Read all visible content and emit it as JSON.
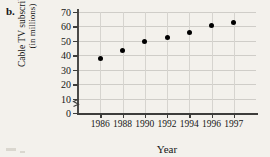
{
  "figure": {
    "problem_label": "b."
  },
  "chart_data": {
    "type": "scatter",
    "title": "",
    "xlabel": "Year",
    "ylabel_line1": "Cable TV subscribers",
    "ylabel_line2": "(in millions)",
    "categories": [
      "1986",
      "1988",
      "1990",
      "1992",
      "1994",
      "1996",
      "1997"
    ],
    "values": [
      37.5,
      43.5,
      49.5,
      52.5,
      56,
      60.5,
      62.5
    ],
    "x": [
      1986,
      1988,
      1990,
      1992,
      1994,
      1996,
      1997
    ],
    "ylim": [
      0,
      70
    ],
    "yticks": [
      0,
      10,
      20,
      30,
      40,
      50,
      60,
      70
    ],
    "ytick_labels": [
      "0",
      "10",
      "20",
      "30",
      "40",
      "50",
      "60",
      "70"
    ],
    "xtick_labels": [
      "1986",
      "1988",
      "1990",
      "1992",
      "1994",
      "1996",
      "1997"
    ],
    "grid": true,
    "legend": "none",
    "y_axis_break": true,
    "marker": "filled-circle",
    "marker_color": "#000000",
    "grid_color": "#cfcdc8",
    "axis_color": "#3d3d3b",
    "background_color": "#f3f1ec"
  }
}
